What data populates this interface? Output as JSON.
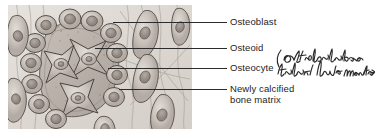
{
  "figure": {
    "kind": "histology-illustration",
    "panel": {
      "background_color": "#ded9d4",
      "cell_fill_color": "#c9c2bb",
      "matrix_fill_color": "#b9b1a9",
      "outline_color": "#4a4540"
    }
  },
  "labels": [
    {
      "id": "osteoblast",
      "text": "Osteoblast"
    },
    {
      "id": "osteoid",
      "text": "Osteoid"
    },
    {
      "id": "osteocyte",
      "text": "Osteocyte"
    },
    {
      "id": "bone-matrix",
      "text": "Newly calcified\nbone matrix"
    }
  ],
  "annotation": {
    "text": "(osteoblasts that have matured",
    "style": "handwritten-ink",
    "color": "#2a2a2a"
  },
  "leader_lines": {
    "color": "#2b2b2b",
    "count": 4
  }
}
